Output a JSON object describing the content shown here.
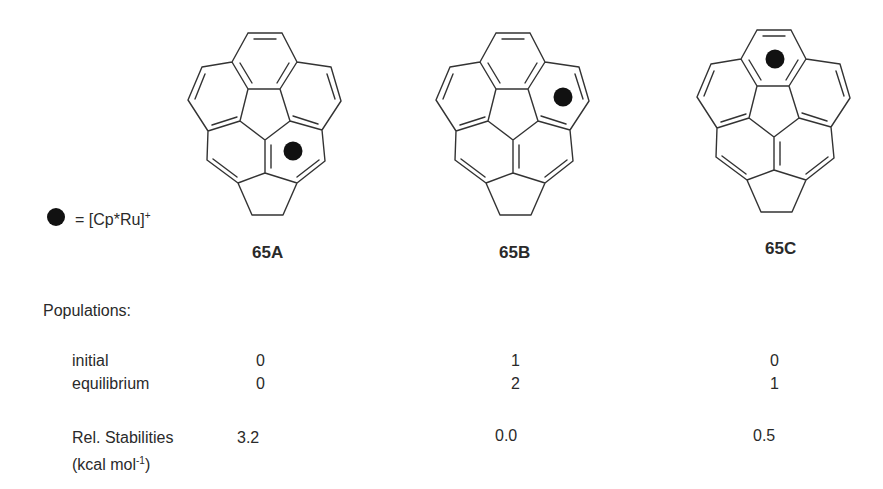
{
  "legend": {
    "symbol": "filled-black-circle",
    "text": "= [Cp*Ru]",
    "superscript": "+"
  },
  "compounds": [
    {
      "id": "65A",
      "label": "65A",
      "ru_position": "lower-right ring"
    },
    {
      "id": "65B",
      "label": "65B",
      "ru_position": "upper-right ring"
    },
    {
      "id": "65C",
      "label": "65C",
      "ru_position": "top ring"
    }
  ],
  "populations": {
    "heading": "Populations:",
    "rows": [
      {
        "label": "initial",
        "values": [
          "0",
          "1",
          "0"
        ]
      },
      {
        "label": "equilibrium",
        "values": [
          "0",
          "2",
          "1"
        ]
      }
    ]
  },
  "stabilities": {
    "label": "Rel. Stabilities",
    "unit_prefix": "(kcal mol",
    "unit_sup": "-1",
    "unit_suffix": ")",
    "values": [
      "3.2",
      "0.0",
      "0.5"
    ]
  },
  "colors": {
    "bond": "#333333",
    "ru_marker": "#111111",
    "text": "#2a2a2a"
  }
}
